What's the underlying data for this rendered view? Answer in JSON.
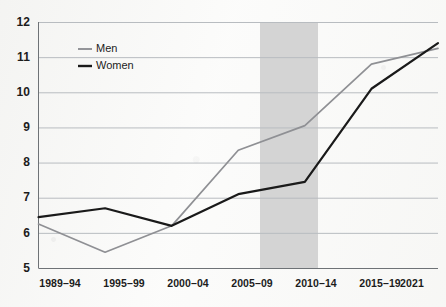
{
  "chart_data": {
    "type": "line",
    "title": "",
    "subtitle": "",
    "xlabel": "",
    "ylabel": "",
    "categories": [
      "1989–94",
      "1995–99",
      "2000–04",
      "2005–09",
      "2010–14",
      "2015–19",
      "2021"
    ],
    "ylim": [
      5,
      12
    ],
    "yticks": [
      5,
      6,
      7,
      8,
      9,
      10,
      11,
      12
    ],
    "ytick_labels": [
      "5",
      "6",
      "7",
      "8",
      "9",
      "10",
      "11",
      "12"
    ],
    "grid": true,
    "grid_axis": "y",
    "legend_position": "top-left-inside",
    "series": [
      {
        "name": "Men",
        "color": "#8f9094",
        "values": [
          6.25,
          5.45,
          6.2,
          8.35,
          9.05,
          10.8,
          11.25
        ]
      },
      {
        "name": "Women",
        "color": "#1a1a1a",
        "values": [
          6.45,
          6.7,
          6.2,
          7.1,
          7.45,
          10.1,
          11.4
        ]
      }
    ],
    "annotations": [
      {
        "type": "vertical-band",
        "label": "highlighted-period",
        "from_category": "2010–14",
        "color": "#d4d4d4"
      }
    ]
  },
  "legend": {
    "items": [
      {
        "label": "Men",
        "color": "#8f9094"
      },
      {
        "label": "Women",
        "color": "#1a1a1a"
      }
    ]
  },
  "axes": {
    "y": {
      "labels": [
        "12",
        "11",
        "10",
        "9",
        "8",
        "7",
        "6",
        "5"
      ]
    },
    "x": {
      "labels": [
        "1989–94",
        "1995–99",
        "2000–04",
        "2005–09",
        "2010–14",
        "2015–19",
        "2021"
      ]
    }
  },
  "colors": {
    "men_line": "#8f9094",
    "women_line": "#1a1a1a",
    "grid": "#b8bcc0",
    "axis": "#6e7276",
    "band": "#d4d4d4",
    "text": "#1c1c1c",
    "background": "#fbfbfa"
  }
}
